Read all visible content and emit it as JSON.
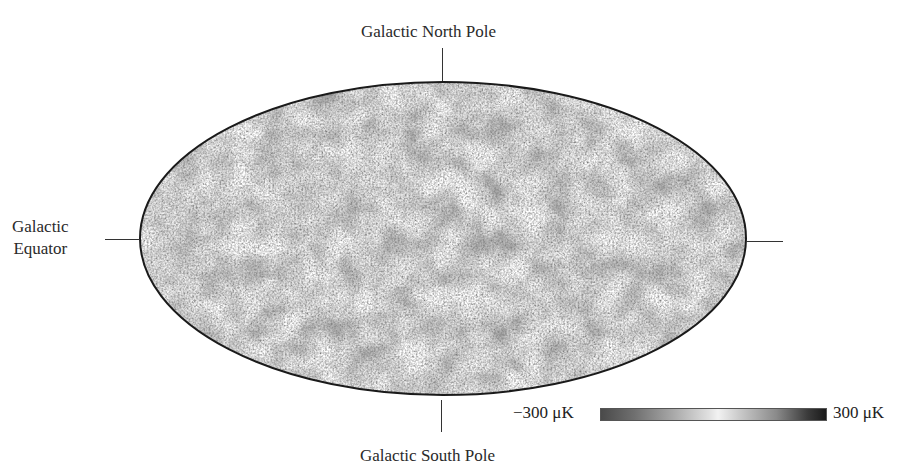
{
  "figure": {
    "labels": {
      "north": "Galactic North Pole",
      "south": "Galactic South Pole",
      "equator_line1": "Galactic",
      "equator_line2": "Equator"
    },
    "colorbar": {
      "min_label": "−300 μK",
      "max_label": "300 μK",
      "min_value": -300,
      "max_value": 300,
      "unit": "μK",
      "colors": [
        "#4a4a4a",
        "#a8a8a8",
        "#f2f2f2",
        "#8a8a8a",
        "#1a1a1a"
      ]
    },
    "map": {
      "projection": "Mollweide",
      "fill_base": "#b4b4b4",
      "outline": "#1a1a1a"
    }
  }
}
